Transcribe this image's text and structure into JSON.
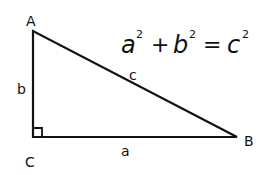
{
  "diagram": {
    "equation": {
      "a": "a",
      "b": "b",
      "c": "c",
      "exp": "2",
      "plus": "+",
      "equals": "="
    },
    "vertices": {
      "A": {
        "label": "A",
        "x": 33,
        "y": 31
      },
      "B": {
        "label": "B",
        "x": 237,
        "y": 137
      },
      "C": {
        "label": "C",
        "x": 33,
        "y": 137
      }
    },
    "sides": {
      "a": "a",
      "b": "b",
      "c": "c"
    },
    "colors": {
      "stroke": "#111111",
      "background": "#ffffff"
    }
  }
}
